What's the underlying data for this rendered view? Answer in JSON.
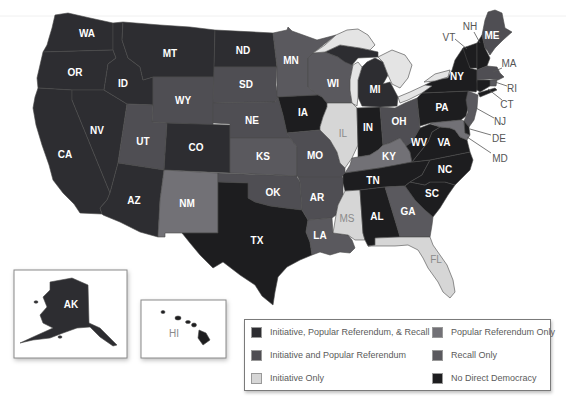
{
  "legend": {
    "items": [
      {
        "id": "irr",
        "label": "Initiative, Popular Referendum, & Recall",
        "color": "#2d2d31"
      },
      {
        "id": "ipr",
        "label": "Initiative and Popular Referendum",
        "color": "#4f4e53"
      },
      {
        "id": "io",
        "label": "Initiative Only",
        "color": "#d6d6d6"
      },
      {
        "id": "pro",
        "label": "Popular Referendum Only",
        "color": "#727176"
      },
      {
        "id": "ro",
        "label": "Recall Only",
        "color": "#5a595e"
      },
      {
        "id": "none",
        "label": "No Direct Democracy",
        "color": "#1d1d1f"
      }
    ]
  },
  "map": {
    "lake_color": "#e4e4e4",
    "states": {
      "WA": {
        "label": "WA",
        "category": "irr"
      },
      "OR": {
        "label": "OR",
        "category": "irr"
      },
      "CA": {
        "label": "CA",
        "category": "irr"
      },
      "NV": {
        "label": "NV",
        "category": "irr"
      },
      "ID": {
        "label": "ID",
        "category": "irr"
      },
      "MT": {
        "label": "MT",
        "category": "irr"
      },
      "WY": {
        "label": "WY",
        "category": "ipr"
      },
      "UT": {
        "label": "UT",
        "category": "ipr"
      },
      "AZ": {
        "label": "AZ",
        "category": "irr"
      },
      "CO": {
        "label": "CO",
        "category": "irr"
      },
      "NM": {
        "label": "NM",
        "category": "pro"
      },
      "ND": {
        "label": "ND",
        "category": "irr"
      },
      "SD": {
        "label": "SD",
        "category": "ipr"
      },
      "NE": {
        "label": "NE",
        "category": "ipr"
      },
      "KS": {
        "label": "KS",
        "category": "ro"
      },
      "OK": {
        "label": "OK",
        "category": "ipr"
      },
      "TX": {
        "label": "TX",
        "category": "none"
      },
      "MN": {
        "label": "MN",
        "category": "ro"
      },
      "IA": {
        "label": "IA",
        "category": "none"
      },
      "MO": {
        "label": "MO",
        "category": "ipr"
      },
      "AR": {
        "label": "AR",
        "category": "ipr"
      },
      "LA": {
        "label": "LA",
        "category": "ro"
      },
      "WI": {
        "label": "WI",
        "category": "ro"
      },
      "IL": {
        "label": "IL",
        "category": "io"
      },
      "MI": {
        "label": "MI",
        "category": "irr"
      },
      "IN": {
        "label": "IN",
        "category": "none"
      },
      "OH": {
        "label": "OH",
        "category": "ipr"
      },
      "KY": {
        "label": "KY",
        "category": "pro"
      },
      "TN": {
        "label": "TN",
        "category": "none"
      },
      "MS": {
        "label": "MS",
        "category": "io"
      },
      "AL": {
        "label": "AL",
        "category": "none"
      },
      "GA": {
        "label": "GA",
        "category": "ro"
      },
      "FL": {
        "label": "FL",
        "category": "io"
      },
      "SC": {
        "label": "SC",
        "category": "none"
      },
      "NC": {
        "label": "NC",
        "category": "none"
      },
      "VA": {
        "label": "VA",
        "category": "none"
      },
      "WV": {
        "label": "WV",
        "category": "none"
      },
      "PA": {
        "label": "PA",
        "category": "none"
      },
      "NY": {
        "label": "NY",
        "category": "none"
      },
      "VT": {
        "label": "VT",
        "category": "none"
      },
      "NH": {
        "label": "NH",
        "category": "none"
      },
      "ME": {
        "label": "ME",
        "category": "ipr"
      },
      "MA": {
        "label": "MA",
        "category": "ipr"
      },
      "RI": {
        "label": "RI",
        "category": "ro"
      },
      "CT": {
        "label": "CT",
        "category": "none"
      },
      "NJ": {
        "label": "NJ",
        "category": "ro"
      },
      "DE": {
        "label": "DE",
        "category": "none"
      },
      "MD": {
        "label": "MD",
        "category": "pro"
      },
      "AK": {
        "label": "AK",
        "category": "irr"
      },
      "HI": {
        "label": "HI",
        "category": "none"
      }
    }
  }
}
